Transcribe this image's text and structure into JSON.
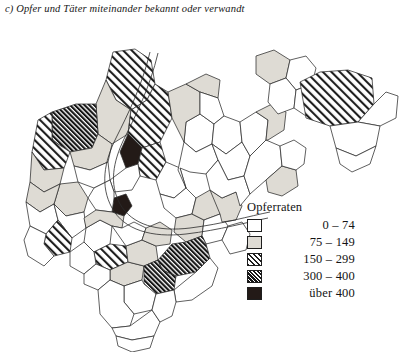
{
  "figure": {
    "title": "c) Opfer und Täter miteinander bekannt oder verwandt",
    "background_color": "#ffffff",
    "ink_color": "#2b2b2b"
  },
  "legend": {
    "title": "Opferraten",
    "classes": [
      {
        "id": "c0",
        "label": "0 – 74",
        "swatch": "white",
        "color": "#ffffff"
      },
      {
        "id": "c1",
        "label": "75 – 149",
        "swatch": "light-gray",
        "color": "#dedbd4"
      },
      {
        "id": "c2",
        "label": "150 – 299",
        "swatch": "diagonal-hatch",
        "color": "#1e1e1e"
      },
      {
        "id": "c3",
        "label": "300 – 400",
        "swatch": "dense-hatch",
        "color": "#151515"
      },
      {
        "id": "c4",
        "label": "über 400",
        "swatch": "solid-black",
        "color": "#231a17"
      }
    ]
  },
  "chart_data": {
    "type": "map",
    "subtype": "choropleth",
    "title": "c) Opfer und Täter miteinander bekannt oder verwandt",
    "value_label": "Opferraten",
    "legend_position": "bottom-right",
    "grid": false,
    "classes": [
      "0 – 74",
      "75 – 149",
      "150 – 299",
      "300 – 400",
      "über 400"
    ],
    "class_counts": [
      33,
      12,
      12,
      5,
      2
    ],
    "region_count": 64,
    "regions": [
      {
        "id": "r01",
        "class": "c2",
        "points": "113,30 135,27 151,38 155,62 147,78 131,88 116,78 106,58"
      },
      {
        "id": "r02",
        "class": "c1",
        "points": "106,58 116,78 131,88 128,112 112,122 98,112 96,82"
      },
      {
        "id": "r03",
        "class": "c2",
        "points": "131,88 147,78 155,62 168,70 172,96 160,120 142,126 128,112"
      },
      {
        "id": "r04",
        "class": "c3",
        "points": "52,90 76,82 96,82 98,112 92,126 70,130 52,118"
      },
      {
        "id": "r05",
        "class": "c2",
        "points": "38,98 52,90 52,118 70,130 64,146 44,148 32,130"
      },
      {
        "id": "r06",
        "class": "c1",
        "points": "32,130 44,148 64,146 60,162 44,170 30,160"
      },
      {
        "id": "r07",
        "class": "c1",
        "points": "70,130 92,126 98,112 112,122 108,140 90,148 74,144"
      },
      {
        "id": "r08",
        "class": "c0",
        "points": "74,144 90,148 108,140 110,158 94,166 78,160"
      },
      {
        "id": "r09",
        "class": "c4",
        "points": "128,112 142,126 138,142 126,146 120,130"
      },
      {
        "id": "r10",
        "class": "c2",
        "points": "142,126 160,120 166,140 156,158 140,154 138,142"
      },
      {
        "id": "r11",
        "class": "c0",
        "points": "110,158 126,146 138,142 140,154 132,168 114,170"
      },
      {
        "id": "r12",
        "class": "c4",
        "points": "114,176 126,172 132,184 124,194 112,190"
      },
      {
        "id": "r13",
        "class": "c0",
        "points": "94,166 110,158 114,170 114,176 112,190 96,188 88,176"
      },
      {
        "id": "r14",
        "class": "c1",
        "points": "60,162 78,160 88,176 84,190 66,194 54,182"
      },
      {
        "id": "r15",
        "class": "c1",
        "points": "30,160 44,170 60,162 54,182 40,190 26,180"
      },
      {
        "id": "r16",
        "class": "c0",
        "points": "26,180 40,190 54,182 58,198 46,212 30,204"
      },
      {
        "id": "r17",
        "class": "c0",
        "points": "54,182 66,194 84,190 86,206 72,216 58,198"
      },
      {
        "id": "r18",
        "class": "c2",
        "points": "58,198 72,216 70,230 54,234 44,222 46,212"
      },
      {
        "id": "r19",
        "class": "c0",
        "points": "30,204 46,212 44,222 54,234 44,244 28,234 24,218"
      },
      {
        "id": "r20",
        "class": "c0",
        "points": "86,206 100,198 112,204 110,222 94,230 84,220"
      },
      {
        "id": "r21",
        "class": "c1",
        "points": "96,188 112,190 124,194 122,206 112,204 100,198 86,206 84,196"
      },
      {
        "id": "r22",
        "class": "c2",
        "points": "94,230 110,222 126,224 128,240 110,248 96,242"
      },
      {
        "id": "r23",
        "class": "c0",
        "points": "70,230 84,220 94,230 96,242 84,252 70,244"
      },
      {
        "id": "r24",
        "class": "c1",
        "points": "110,248 128,240 144,244 142,258 124,264 110,258"
      },
      {
        "id": "r25",
        "class": "c0",
        "points": "84,252 96,242 110,248 110,258 98,268 84,262"
      },
      {
        "id": "r26",
        "class": "c1",
        "points": "126,224 142,218 156,224 158,238 144,244 128,240"
      },
      {
        "id": "r27",
        "class": "c0",
        "points": "122,206 134,200 146,206 142,218 126,224 112,204"
      },
      {
        "id": "r28",
        "class": "c1",
        "points": "146,206 160,200 172,208 170,222 156,224 142,218"
      },
      {
        "id": "r29",
        "class": "c0",
        "points": "156,158 166,140 180,146 186,166 174,176 160,172"
      },
      {
        "id": "r30",
        "class": "c0",
        "points": "160,172 174,176 186,166 196,176 192,192 176,196 164,186"
      },
      {
        "id": "r31",
        "class": "c1",
        "points": "176,196 192,192 204,198 202,214 186,220 174,210"
      },
      {
        "id": "r32",
        "class": "c1",
        "points": "196,176 210,168 222,176 220,192 204,198 192,192"
      },
      {
        "id": "r33",
        "class": "c0",
        "points": "204,198 220,192 228,204 222,218 206,222 202,214"
      },
      {
        "id": "r34",
        "class": "c3",
        "points": "158,238 172,222 186,220 202,214 206,222 210,236 196,250 176,254 162,248"
      },
      {
        "id": "r35",
        "class": "c3",
        "points": "144,244 158,238 162,248 176,254 174,268 156,272 144,262"
      },
      {
        "id": "r36",
        "class": "c0",
        "points": "124,264 142,258 144,262 156,272 152,288 134,292 124,280"
      },
      {
        "id": "r37",
        "class": "c0",
        "points": "98,268 110,258 124,264 124,280 134,292 130,304 112,306 100,292"
      },
      {
        "id": "r38",
        "class": "c0",
        "points": "112,306 130,304 152,288 160,300 154,314 132,318 116,314"
      },
      {
        "id": "r39",
        "class": "c0",
        "points": "116,314 132,318 154,314 150,326 132,330 118,324"
      },
      {
        "id": "r40",
        "class": "c0",
        "points": "174,268 196,250 210,236 218,246 212,264 192,278 176,280"
      },
      {
        "id": "r41",
        "class": "c0",
        "points": "156,272 174,268 176,280 172,294 160,300 152,288"
      },
      {
        "id": "r42",
        "class": "c0",
        "points": "222,218 228,204 242,200 250,212 246,228 230,232"
      },
      {
        "id": "r43",
        "class": "c1",
        "points": "210,168 222,176 236,170 242,184 236,198 222,200 220,192"
      },
      {
        "id": "r44",
        "class": "c0",
        "points": "186,100 200,92 214,102 212,122 196,130 184,120"
      },
      {
        "id": "r45",
        "class": "c0",
        "points": "184,120 196,130 212,122 218,138 206,152 190,150 180,146 186,166 178,148"
      },
      {
        "id": "r46",
        "class": "c1",
        "points": "168,70 186,62 200,70 200,92 186,100 184,120 172,96"
      },
      {
        "id": "r47",
        "class": "c1",
        "points": "186,62 206,52 220,58 218,76 200,70"
      },
      {
        "id": "r48",
        "class": "c0",
        "points": "200,70 218,76 224,94 214,102 200,92"
      },
      {
        "id": "r49",
        "class": "c0",
        "points": "214,102 224,94 240,100 242,120 226,132 212,122"
      },
      {
        "id": "r50",
        "class": "c0",
        "points": "212,122 226,132 242,120 250,134 244,154 228,158 218,138"
      },
      {
        "id": "r51",
        "class": "c0",
        "points": "218,138 228,158 244,154 250,172 240,184 236,170 222,176 210,168 206,152"
      },
      {
        "id": "r52",
        "class": "c0",
        "points": "240,100 256,90 268,98 266,118 250,134 242,120"
      },
      {
        "id": "r53",
        "class": "c0",
        "points": "250,134 266,118 280,124 282,144 266,158 250,172 244,154"
      },
      {
        "id": "r54",
        "class": "c1",
        "points": "256,90 272,82 286,90 284,108 268,118 266,118 268,98"
      },
      {
        "id": "r55",
        "class": "c1",
        "points": "266,158 282,144 296,148 298,164 282,174 268,170"
      },
      {
        "id": "r56",
        "class": "c0",
        "points": "282,144 280,124 294,118 306,126 304,142 296,148"
      },
      {
        "id": "r57",
        "class": "c1",
        "points": "256,34 274,28 290,38 286,56 270,62 256,52"
      },
      {
        "id": "r58",
        "class": "c0",
        "points": "286,56 290,38 306,34 316,46 312,62 296,68"
      },
      {
        "id": "r59",
        "class": "c0",
        "points": "270,62 286,56 296,68 294,86 278,92 268,80"
      },
      {
        "id": "r60",
        "class": "c0",
        "points": "296,68 312,62 324,70 322,88 306,94 294,86"
      },
      {
        "id": "r61",
        "class": "c2",
        "points": "300,60 320,50 348,48 372,56 374,82 358,100 330,104 306,96"
      },
      {
        "id": "r62",
        "class": "c0",
        "points": "374,82 386,70 398,74 396,96 380,104 358,100"
      },
      {
        "id": "r63",
        "class": "c0",
        "points": "330,104 358,100 380,104 376,124 356,134 336,126"
      },
      {
        "id": "r64",
        "class": "c0",
        "points": "336,126 356,134 376,124 370,142 352,150 340,142"
      }
    ]
  }
}
